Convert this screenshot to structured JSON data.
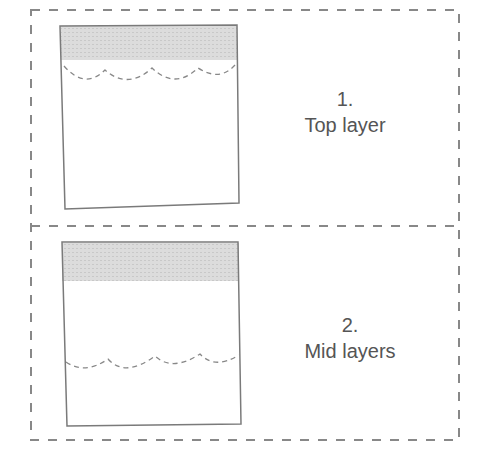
{
  "panels": [
    {
      "number": "1.",
      "label": "Top layer"
    },
    {
      "number": "2.",
      "label": "Mid layers"
    }
  ],
  "colors": {
    "line": "#7a7a7a",
    "shade": "#d4d4d4",
    "text": "#555555"
  }
}
